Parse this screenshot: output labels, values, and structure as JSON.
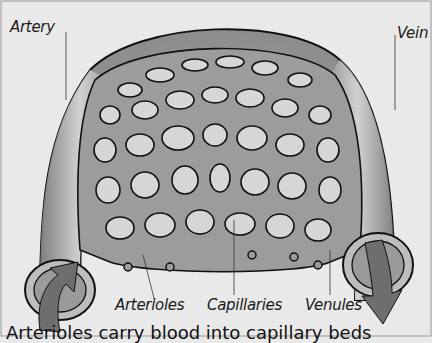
{
  "diagram": {
    "title": "Capillary bed",
    "labels": {
      "artery": "Artery",
      "vein": "Vein",
      "arterioles": "Arterioles",
      "capillaries": "Capillaries",
      "venules": "Venules"
    },
    "caption_partial": "Arterioles carry blood into capillary beds",
    "colors": {
      "background": "#e9e9e9",
      "vessel": "#9a9a9a",
      "vessel_light": "#c8c8c8",
      "outline": "#111111",
      "arrow": "#6e6e6e"
    },
    "flow": {
      "in": "arrow-up-into-artery",
      "out": "arrow-down-out-of-vein"
    }
  }
}
